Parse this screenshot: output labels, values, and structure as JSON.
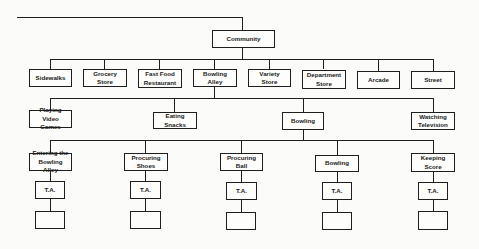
{
  "diagram": {
    "type": "hierarchy",
    "root": {
      "label": "Community"
    },
    "level1": [
      {
        "label": "Sidewalks"
      },
      {
        "label": "Grocery Store"
      },
      {
        "label": "Fast Food Restaurant"
      },
      {
        "label": "Bowling Alley"
      },
      {
        "label": "Variety Store"
      },
      {
        "label": "Department Store"
      },
      {
        "label": "Arcade"
      },
      {
        "label": "Street"
      }
    ],
    "level2_parent": "Bowling Alley",
    "level2": [
      {
        "label": "Playing Video Games"
      },
      {
        "label": "Eating Snacks"
      },
      {
        "label": "Bowling"
      },
      {
        "label": "Watching Television"
      }
    ],
    "level3_parent": "Bowling",
    "level3": [
      {
        "label": "Entering the Bowling Alley",
        "child": "T.A."
      },
      {
        "label": "Procuring Shoes",
        "child": "T.A."
      },
      {
        "label": "Procuring Ball",
        "child": "T.A."
      },
      {
        "label": "Bowling",
        "child": "T.A."
      },
      {
        "label": "Keeping Score",
        "child": "T.A."
      }
    ]
  }
}
